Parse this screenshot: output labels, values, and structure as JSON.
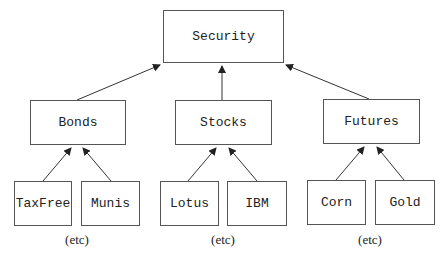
{
  "diagram": {
    "root": {
      "label": "Security"
    },
    "categories": [
      {
        "label": "Bonds",
        "children": [
          "TaxFree",
          "Munis"
        ],
        "more": "(etc)"
      },
      {
        "label": "Stocks",
        "children": [
          "Lotus",
          "IBM"
        ],
        "more": "(etc)"
      },
      {
        "label": "Futures",
        "children": [
          "Corn",
          "Gold"
        ],
        "more": "(etc)"
      }
    ],
    "edge_style": "arrow points from child to parent",
    "colors": {
      "line": "#333333",
      "box_border": "#555555",
      "background": "#ffffff"
    }
  }
}
